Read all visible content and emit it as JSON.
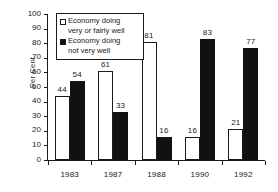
{
  "chart_data": {
    "type": "bar",
    "title": "",
    "subtitle": "",
    "xlabel": "",
    "ylabel": "Per Cent",
    "categories": [
      "1983",
      "1987",
      "1988",
      "1990",
      "1992"
    ],
    "series": [
      {
        "name": "Economy doing very or fairly well",
        "color": "#ffffff",
        "edge_color": "#1a1a1a",
        "values": [
          44,
          61,
          81,
          16,
          21
        ]
      },
      {
        "name": "Economy doing not very well",
        "color": "#111111",
        "edge_color": "#111111",
        "values": [
          54,
          33,
          16,
          83,
          77
        ]
      }
    ],
    "ylim": [
      0,
      100
    ],
    "ytick_labels": [
      "0",
      "10",
      "20",
      "30",
      "40",
      "50",
      "60",
      "70",
      "80",
      "90",
      "100"
    ],
    "ytick_values": [
      0,
      10,
      20,
      30,
      40,
      50,
      60,
      70,
      80,
      90,
      100
    ],
    "grid": false,
    "data_labels": true,
    "legend_position": "upper-left-inside"
  },
  "legend": {
    "entries": [
      {
        "swatch": "light",
        "line1": "Economy doing",
        "line2": "very or fairly well"
      },
      {
        "swatch": "dark",
        "line1": "Economy doing",
        "line2": "not very well"
      }
    ]
  }
}
